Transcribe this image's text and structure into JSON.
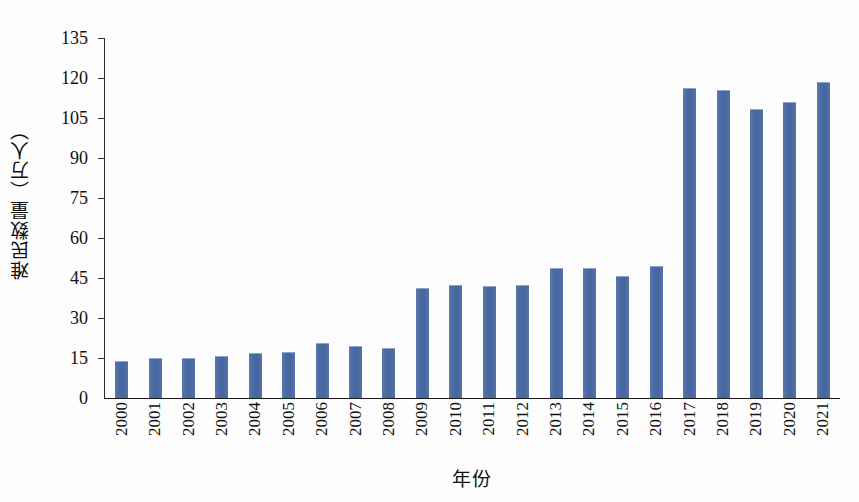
{
  "chart_data": {
    "type": "bar",
    "title": "",
    "xlabel": "年份",
    "ylabel": "难民数量（万人）",
    "categories": [
      "2000",
      "2001",
      "2002",
      "2003",
      "2004",
      "2005",
      "2006",
      "2007",
      "2008",
      "2009",
      "2010",
      "2011",
      "2012",
      "2013",
      "2014",
      "2015",
      "2016",
      "2017",
      "2018",
      "2019",
      "2020",
      "2021"
    ],
    "values": [
      13.5,
      14.6,
      14.8,
      15.2,
      16.5,
      16.8,
      20.3,
      19.0,
      18.5,
      41.0,
      42.0,
      41.7,
      42.0,
      48.5,
      48.3,
      45.5,
      49.3,
      116.0,
      115.0,
      108.0,
      110.5,
      118.0
    ],
    "series": [
      {
        "name": "难民数量",
        "color": "#4a6ba4",
        "values": [
          13.5,
          14.6,
          14.8,
          15.2,
          16.5,
          16.8,
          20.3,
          19.0,
          18.5,
          41.0,
          42.0,
          41.7,
          42.0,
          48.5,
          48.3,
          45.5,
          49.3,
          116.0,
          115.0,
          108.0,
          110.5,
          118.0
        ]
      }
    ],
    "yticks": [
      0,
      15,
      30,
      45,
      60,
      75,
      90,
      105,
      120,
      135
    ],
    "ytick_labels": [
      "0",
      "15",
      "30",
      "45",
      "60",
      "75",
      "90",
      "105",
      "120",
      "135"
    ],
    "ylim": [
      0,
      135
    ],
    "grid": false,
    "legend": false,
    "legend_position": "none",
    "bar_color": "#4a6ba4",
    "axis_color": "#1a1a1a",
    "background_color": "#ffffff",
    "xtick_rotation": 90
  }
}
